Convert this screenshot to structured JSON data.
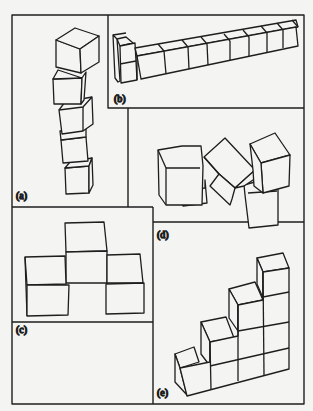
{
  "figure": {
    "background": "#f4f4f2",
    "line_color": "#1e1e1e",
    "panels": [
      {
        "id": "a",
        "label": "(a)",
        "description": "Vertical tower of five stacked cubes, each slightly rotated"
      },
      {
        "id": "b",
        "label": "(b)",
        "description": "Long row of cubes in perspective, two-high at the left end"
      },
      {
        "id": "c",
        "label": "(c)",
        "description": "Four cubes: three in a bottom row with one on top in the middle, front view"
      },
      {
        "id": "d",
        "label": "(d)",
        "description": "Two cube stacks with a tilted cube balanced between them"
      },
      {
        "id": "e",
        "label": "(e)",
        "description": "Staircase of cubes rising to the right, heights 1-2-3-4"
      }
    ]
  }
}
